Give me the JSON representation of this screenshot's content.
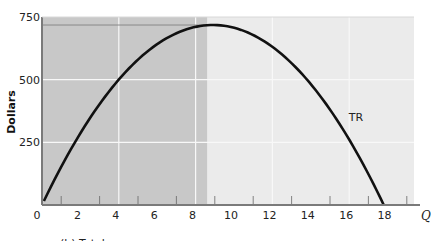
{
  "chart_data": {
    "type": "line",
    "title": "",
    "xlabel": "Q",
    "ylabel": "Dollars",
    "xlim": [
      0,
      19.4
    ],
    "ylim": [
      0,
      750
    ],
    "x_ticks": [
      0,
      2,
      4,
      6,
      8,
      10,
      12,
      14,
      16,
      18
    ],
    "x_tick_labels": [
      "0",
      "2",
      "4",
      "6",
      "8",
      "10",
      "12",
      "14",
      "16",
      "18"
    ],
    "y_ticks": [
      250,
      500,
      750
    ],
    "y_tick_labels": [
      "250",
      "500",
      "750"
    ],
    "grid": true,
    "series": [
      {
        "name": "TR",
        "x": [
          0,
          1,
          2,
          3,
          4,
          5,
          6,
          7,
          8,
          8.9,
          10,
          11,
          12,
          13,
          14,
          15,
          16,
          17,
          17.8
        ],
        "values": [
          0,
          152,
          286,
          402,
          500,
          580,
          642,
          686,
          712,
          718,
          707,
          678,
          631,
          566,
          482,
          381,
          261,
          123,
          0
        ]
      }
    ],
    "annotations": [
      {
        "type": "shaded-region",
        "x_from": 0,
        "x_to": 8.6,
        "note": "darker gray region left of revenue maximum"
      },
      {
        "type": "horizontal-line",
        "y": 718,
        "note": "max total revenue level"
      }
    ],
    "caption_partial": "(b) Total..."
  },
  "labels": {
    "y_axis": "Dollars",
    "x_axis": "Q",
    "series": "TR",
    "caption": "(b) Total"
  },
  "colors": {
    "shaded": "#c8c8c8",
    "unshaded": "#ebebeb",
    "curve": "#111111",
    "grid": "#f8f8f8",
    "axis": "#7a7a7a"
  }
}
